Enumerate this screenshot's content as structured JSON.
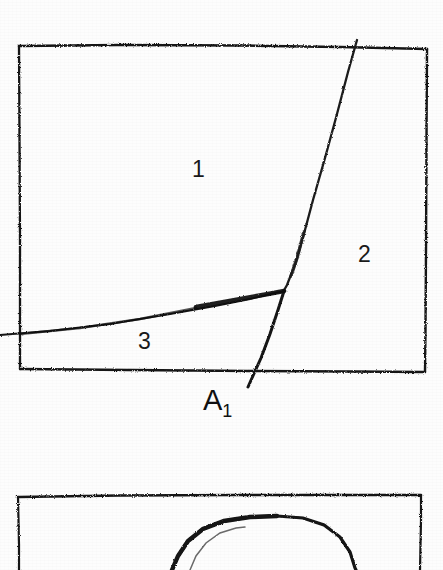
{
  "page": {
    "background_color": "#fdfdfd",
    "ink_color": "#161616",
    "width": 443,
    "height": 570
  },
  "figures": [
    {
      "id": "figure-top",
      "kind": "partitioned-rectangle",
      "frame": {
        "x": 18,
        "y": 45,
        "width": 408,
        "height": 327
      },
      "region_labels": [
        {
          "text": "1",
          "x": 199,
          "y": 170
        },
        {
          "text": "2",
          "x": 365,
          "y": 255
        },
        {
          "text": "3",
          "x": 145,
          "y": 342
        }
      ],
      "junction_labels": [
        {
          "base": "A",
          "sub": "1",
          "x": 232,
          "y": 403
        }
      ],
      "boundaries": [
        {
          "name": "boundary-1-2",
          "description": "slanted grain boundary from top edge down to triple junction",
          "from": {
            "x": 357,
            "y": 40
          },
          "to": {
            "x": 283,
            "y": 292
          }
        },
        {
          "name": "boundary-2-3",
          "description": "short boundary from triple junction down-left through bottom edge",
          "from": {
            "x": 283,
            "y": 292
          },
          "to": {
            "x": 248,
            "y": 387
          }
        },
        {
          "name": "boundary-1-3",
          "description": "near-horizontal boundary from triple junction left past the frame edge",
          "from": {
            "x": 283,
            "y": 290
          },
          "to": {
            "x": 0,
            "y": 335
          }
        }
      ],
      "triple_junction": {
        "x": 283,
        "y": 292
      }
    },
    {
      "id": "figure-bottom",
      "kind": "partitioned-rectangle-cropped",
      "frame": {
        "x": 17,
        "y": 495,
        "width": 404,
        "height": 75
      },
      "region_labels": [],
      "junction_labels": [],
      "boundaries": [
        {
          "name": "boundary-arc-outer",
          "description": "curved arc rising from lower left, peaking near top, descending to lower right",
          "from": {
            "x": 168,
            "y": 570
          },
          "peak": {
            "x": 277,
            "y": 517
          },
          "to": {
            "x": 352,
            "y": 570
          }
        },
        {
          "name": "boundary-arc-inner",
          "description": "faint secondary curve inside the arc",
          "from": {
            "x": 190,
            "y": 570
          },
          "to": {
            "x": 243,
            "y": 528
          }
        }
      ]
    }
  ]
}
